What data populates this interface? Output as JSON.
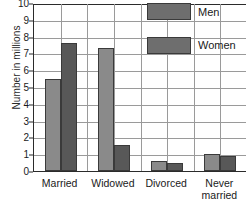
{
  "chart_data": {
    "type": "bar",
    "title": "",
    "xlabel": "",
    "ylabel": "Number in millions",
    "ylim": [
      0,
      10
    ],
    "ytick_step": 1,
    "grid": true,
    "legend_position": "top-right",
    "categories": [
      "Married",
      "Widowed",
      "Divorced",
      "Never married"
    ],
    "category_lines": [
      [
        "Married"
      ],
      [
        "Widowed"
      ],
      [
        "Divorced"
      ],
      [
        "Never",
        "married"
      ]
    ],
    "ytick_labels": [
      "10",
      "9",
      "8",
      "7",
      "6",
      "5",
      "4",
      "3",
      "2",
      "1",
      "0"
    ],
    "series": [
      {
        "name": "Men",
        "color": "#8a8a8a",
        "values": [
          5.5,
          7.35,
          0.62,
          1.02
        ]
      },
      {
        "name": "Women",
        "color": "#585858",
        "values": [
          7.6,
          1.55,
          0.5,
          0.87
        ]
      }
    ]
  },
  "legend": {
    "entries": [
      {
        "label": "Men",
        "swatch": "men-swatch"
      },
      {
        "label": "Women",
        "swatch": "women-swatch"
      }
    ]
  },
  "footer": {
    "partial_text": ""
  }
}
